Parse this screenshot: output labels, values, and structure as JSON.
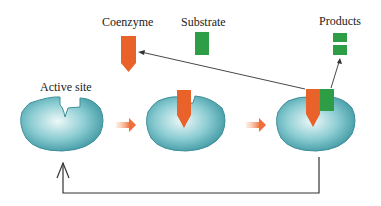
{
  "labels": {
    "coenzyme": "Coenzyme",
    "substrate": "Substrate",
    "products": "Products",
    "active_site": "Active site"
  },
  "colors": {
    "enzyme": "#5fb3bd",
    "enzyme_edge": "#3d8f9a",
    "coenzyme": "#e8622a",
    "substrate": "#2e9e46",
    "arrow_orange": "#f08050",
    "line": "#333333"
  },
  "stages": [
    {
      "name": "free-enzyme",
      "has_coenzyme": false,
      "has_substrate": false
    },
    {
      "name": "enzyme-coenzyme",
      "has_coenzyme": true,
      "has_substrate": false
    },
    {
      "name": "enzyme-coenzyme-substrate",
      "has_coenzyme": true,
      "has_substrate": true
    }
  ]
}
